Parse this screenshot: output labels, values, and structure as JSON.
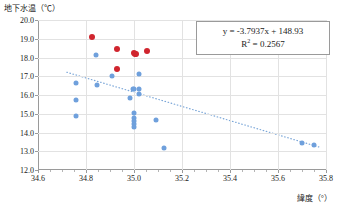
{
  "chart_data": {
    "type": "scatter",
    "title": "",
    "xlabel": "緯度（°）",
    "ylabel": "地下水温（℃）",
    "xlim": [
      34.6,
      35.8
    ],
    "ylim": [
      12.0,
      20.0
    ],
    "xticks": [
      "34.6",
      "34.8",
      "35.0",
      "35.2",
      "35.4",
      "35.6",
      "35.8"
    ],
    "xtick_values": [
      34.6,
      34.8,
      35.0,
      35.2,
      35.4,
      35.6,
      35.8
    ],
    "yticks": [
      "12.0",
      "13.0",
      "14.0",
      "15.0",
      "16.0",
      "17.0",
      "18.0",
      "19.0",
      "20.0"
    ],
    "ytick_values": [
      12.0,
      13.0,
      14.0,
      15.0,
      16.0,
      17.0,
      18.0,
      19.0,
      20.0
    ],
    "grid": true,
    "legend": "none",
    "series": [
      {
        "name": "red-points",
        "color": "#d0252e",
        "marker": "circle",
        "points": [
          {
            "x": 34.825,
            "y": 19.12
          },
          {
            "x": 34.93,
            "y": 18.45
          },
          {
            "x": 34.93,
            "y": 17.38
          },
          {
            "x": 34.998,
            "y": 18.22
          },
          {
            "x": 35.005,
            "y": 18.18
          },
          {
            "x": 35.01,
            "y": 18.17
          },
          {
            "x": 35.055,
            "y": 18.37
          }
        ]
      },
      {
        "name": "blue-points",
        "color": "#6fa0dc",
        "marker": "circle",
        "points": [
          {
            "x": 34.76,
            "y": 16.66
          },
          {
            "x": 34.76,
            "y": 15.76
          },
          {
            "x": 34.758,
            "y": 14.88
          },
          {
            "x": 34.843,
            "y": 18.12
          },
          {
            "x": 34.845,
            "y": 16.56
          },
          {
            "x": 34.908,
            "y": 17.04
          },
          {
            "x": 34.985,
            "y": 15.82
          },
          {
            "x": 34.995,
            "y": 16.3
          },
          {
            "x": 35.0,
            "y": 16.31
          },
          {
            "x": 34.998,
            "y": 15.02
          },
          {
            "x": 34.998,
            "y": 14.76
          },
          {
            "x": 34.998,
            "y": 14.64
          },
          {
            "x": 34.998,
            "y": 14.44
          },
          {
            "x": 34.998,
            "y": 14.28
          },
          {
            "x": 35.02,
            "y": 17.12
          },
          {
            "x": 35.022,
            "y": 16.3
          },
          {
            "x": 35.022,
            "y": 16.04
          },
          {
            "x": 35.09,
            "y": 14.66
          },
          {
            "x": 35.125,
            "y": 13.18
          },
          {
            "x": 35.7,
            "y": 13.46
          },
          {
            "x": 35.748,
            "y": 13.36
          }
        ]
      }
    ],
    "trendline": {
      "slope": -3.7937,
      "intercept": 148.93,
      "style": "dotted",
      "color": "#7aa6d8",
      "x_start": 34.72,
      "x_end": 35.77
    },
    "annotation": {
      "equation": "y = -3.7937x + 148.93",
      "r_squared_label": "R",
      "r_squared_sup": "2",
      "r_squared_value": " = 0.2567"
    }
  }
}
